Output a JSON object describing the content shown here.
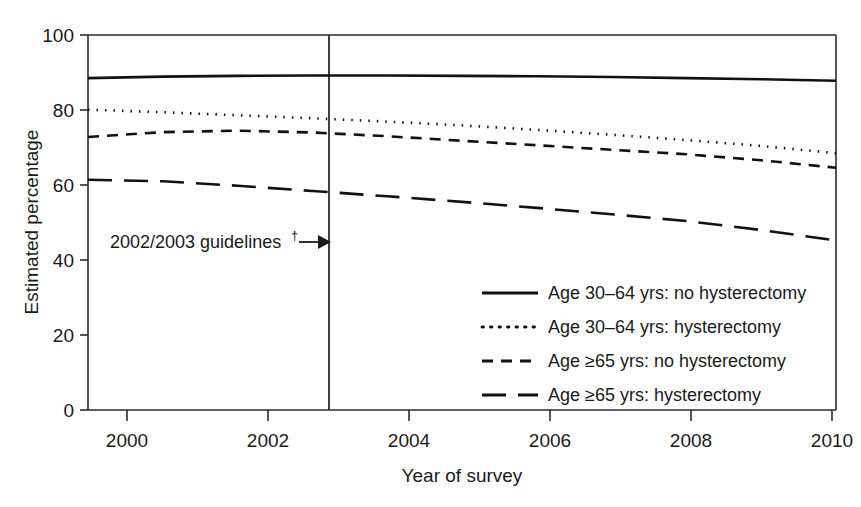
{
  "chart_data": {
    "type": "line",
    "title": "",
    "xlabel": "Year of survey",
    "ylabel": "Estimated percentage",
    "xlim": [
      2000,
      2010
    ],
    "ylim": [
      0,
      100
    ],
    "grid": false,
    "legend_position": "inside-lower-right",
    "x_ticks": [
      "2000",
      "2002",
      "2004",
      "2006",
      "2008",
      "2010"
    ],
    "x_tick_values": [
      2000,
      2002,
      2004,
      2006,
      2008,
      2010
    ],
    "y_ticks": [
      "0",
      "20",
      "40",
      "60",
      "80",
      "100"
    ],
    "y_tick_values": [
      0,
      20,
      40,
      60,
      80,
      100
    ],
    "x": [
      2000,
      2001,
      2002,
      2003,
      2004,
      2005,
      2006,
      2007,
      2008,
      2009,
      2010
    ],
    "series": [
      {
        "name": "Age 30–64 yrs: no hysterectomy",
        "style": "solid",
        "color": "#111111",
        "values": [
          88.5,
          88.9,
          89.1,
          89.2,
          89.2,
          89.1,
          89.0,
          88.8,
          88.5,
          88.2,
          87.8
        ]
      },
      {
        "name": "Age 30–64 yrs: hysterectomy",
        "style": "dotted",
        "color": "#111111",
        "values": [
          80.1,
          79.4,
          78.6,
          77.8,
          76.9,
          75.9,
          74.7,
          73.4,
          72.0,
          70.4,
          68.5
        ]
      },
      {
        "name": "Age ≥65 yrs: no hysterectomy",
        "style": "dashed",
        "color": "#111111",
        "values": [
          72.8,
          74.1,
          74.5,
          74.0,
          73.0,
          71.8,
          70.6,
          69.4,
          68.2,
          66.6,
          64.6
        ]
      },
      {
        "name": "Age ≥65 yrs: hysterectomy",
        "style": "longdash",
        "color": "#111111",
        "values": [
          61.4,
          61.0,
          59.8,
          58.4,
          57.0,
          55.5,
          53.9,
          52.2,
          50.4,
          48.0,
          45.2
        ]
      }
    ],
    "annotations": [
      {
        "name": "guideline-marker",
        "text": "2002/2003 guidelines",
        "superscript": "†",
        "x_value": 2003,
        "y_value": 44,
        "marker": "vertical-line-with-arrow"
      }
    ]
  },
  "legend": {
    "entries": [
      {
        "label": "Age 30–64 yrs: no hysterectomy",
        "style": "solid"
      },
      {
        "label": "Age 30–64 yrs: hysterectomy",
        "style": "dotted"
      },
      {
        "label": "Age ≥65 yrs: no hysterectomy",
        "style": "dashed"
      },
      {
        "label": "Age ≥65 yrs: hysterectomy",
        "style": "longdash"
      }
    ]
  },
  "axes": {
    "x_title": "Year of survey",
    "y_title": "Estimated percentage"
  }
}
